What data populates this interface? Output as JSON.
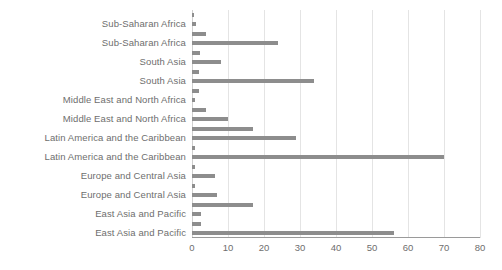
{
  "chart_data": {
    "type": "bar",
    "orientation": "horizontal",
    "title": "",
    "subtitle": "",
    "xlabel": "",
    "ylabel": "",
    "xlim": [
      0,
      80
    ],
    "xticks": [
      0,
      10,
      20,
      30,
      40,
      50,
      60,
      70,
      80
    ],
    "xtick_labels": [
      "0",
      "10",
      "20",
      "30",
      "40",
      "50",
      "60",
      "70",
      "80"
    ],
    "grid": true,
    "grid_axis": "x",
    "legend": false,
    "legend_position": "none",
    "bar_color": "#8d8d8d",
    "grid_color": "#e4e4e4",
    "axis_color": "#9a9a9a",
    "text_color": "#6e6e6e",
    "categories": [
      "Sub-Saharan Africa",
      "Sub-Saharan Africa",
      "South Asia",
      "South Asia",
      "Middle East and North Africa",
      "Middle East and North Africa",
      "Latin America and the Caribbean",
      "Latin America and the Caribbean",
      "Europe and Central Asia",
      "Europe and Central Asia",
      "East Asia and Pacific",
      "East Asia and Pacific"
    ],
    "bars": [
      {
        "label": "",
        "value": 0.6
      },
      {
        "label": "Sub-Saharan Africa",
        "value": 1.0
      },
      {
        "label": "",
        "value": 4.0
      },
      {
        "label": "Sub-Saharan Africa",
        "value": 24.0
      },
      {
        "label": "",
        "value": 2.2
      },
      {
        "label": "South Asia",
        "value": 8.0
      },
      {
        "label": "",
        "value": 2.0
      },
      {
        "label": "South Asia",
        "value": 34.0
      },
      {
        "label": "",
        "value": 2.0
      },
      {
        "label": "Middle East and North Africa",
        "value": 0.8
      },
      {
        "label": "",
        "value": 4.0
      },
      {
        "label": "Middle East and North Africa",
        "value": 10.0
      },
      {
        "label": "",
        "value": 17.0
      },
      {
        "label": "Latin America and the Caribbean",
        "value": 29.0
      },
      {
        "label": "",
        "value": 0.8
      },
      {
        "label": "Latin America and the Caribbean",
        "value": 70.0
      },
      {
        "label": "",
        "value": 0.8
      },
      {
        "label": "Europe and Central Asia",
        "value": 6.5
      },
      {
        "label": "",
        "value": 0.8
      },
      {
        "label": "Europe and Central Asia",
        "value": 7.0
      },
      {
        "label": "",
        "value": 17.0
      },
      {
        "label": "East Asia and Pacific",
        "value": 2.5
      },
      {
        "label": "",
        "value": 2.5
      },
      {
        "label": "East Asia and Pacific",
        "value": 56.0
      }
    ]
  }
}
